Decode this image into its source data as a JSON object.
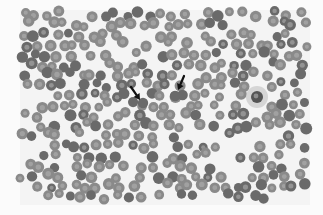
{
  "image": {
    "description": "Grayscale peripheral blood smear micrograph with two arrows pointing at red blood cells",
    "background": "#fbfbfb",
    "field": {
      "x": 20,
      "y": 10,
      "width": 290,
      "height": 195,
      "color": "#f4f4f4"
    },
    "cell_color": "#8a8a8a",
    "cell_dark": "#6a6a6a",
    "cell_pallor": "#b4b4b4",
    "cell_radius": 5.2,
    "grid": {
      "spacing": 11.5,
      "jitter": 3.2,
      "density": 0.78,
      "seed": 7
    },
    "arrows": [
      {
        "name": "arrow-left",
        "x1": 131,
        "y1": 87,
        "x2": 140,
        "y2": 100,
        "color": "#111111"
      },
      {
        "name": "arrow-right",
        "x1": 184,
        "y1": 76,
        "x2": 178,
        "y2": 90,
        "color": "#111111"
      }
    ],
    "target_cells": [
      {
        "x": 143,
        "y": 103
      },
      {
        "x": 175,
        "y": 96
      }
    ],
    "leukocyte": {
      "x": 257,
      "y": 97,
      "r": 8,
      "halo": "#c8c8c8",
      "nucleus": "#555555"
    }
  }
}
